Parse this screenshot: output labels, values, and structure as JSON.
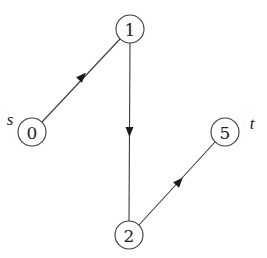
{
  "diagram": {
    "type": "directed-graph",
    "colors": {
      "stroke": "#3a3a3a",
      "text": "#222222",
      "arrow": "#1a1a1a",
      "background": "#ffffff"
    },
    "nodes": [
      {
        "id": "0",
        "label": "0",
        "side_label": "s",
        "x": 32,
        "y": 132
      },
      {
        "id": "1",
        "label": "1",
        "side_label": "",
        "x": 130,
        "y": 29
      },
      {
        "id": "2",
        "label": "2",
        "side_label": "",
        "x": 129,
        "y": 235
      },
      {
        "id": "5",
        "label": "5",
        "side_label": "t",
        "x": 225,
        "y": 132
      }
    ],
    "edges": [
      {
        "from": "0",
        "to": "1"
      },
      {
        "from": "1",
        "to": "2"
      },
      {
        "from": "2",
        "to": "5"
      }
    ],
    "labels": {
      "source": "s",
      "sink": "t"
    }
  }
}
